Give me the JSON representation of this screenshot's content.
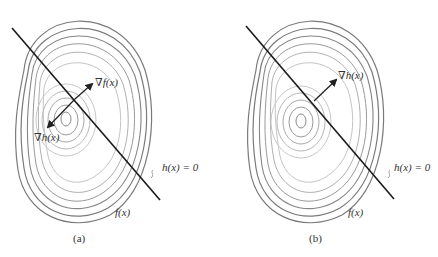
{
  "figure": {
    "panels": [
      {
        "id": "a",
        "sublabel": "(a)",
        "grad_f_label": "∇f(x)",
        "grad_h_label": "∇h(x)",
        "constraint_label": "h(x) = 0",
        "objective_label": "f(x)"
      },
      {
        "id": "b",
        "sublabel": "(b)",
        "grad_h_label": "∇h(x)",
        "constraint_label": "h(x) = 0",
        "objective_label": "f(x)"
      }
    ],
    "colors": {
      "constraint_line": "#1a1a1a",
      "outer_contours": "#7a7a7a",
      "inner_contours": "#bdbdbd",
      "arrows": "#222222",
      "text": "#333333"
    }
  }
}
